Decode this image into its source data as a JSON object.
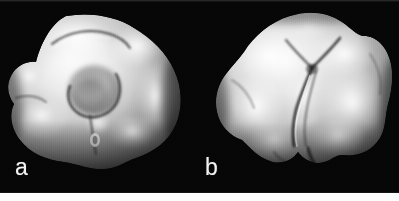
{
  "figure": {
    "kind": "scientific-figure-panel",
    "background_color": "#ffffff",
    "plate_color": "#060606",
    "label_color": "#f2f2f2",
    "surface_highlight_color": "#fdfdfd",
    "surface_midtone_color": "#b9b9b9",
    "surface_shadow_color": "#4a4a4a",
    "groove_color": "#2b2b2b",
    "panels": [
      {
        "id": "a",
        "label": "a",
        "description": "three-dimensional grayscale surface rendering of a globular particle, viewed with a large rounded central depression and a lobed left-hand protrusion"
      },
      {
        "id": "b",
        "label": "b",
        "description": "three-dimensional grayscale surface rendering of the same particle rotated, showing a branched Y-shaped cleft running down the centre and a scalloped lower edge"
      }
    ]
  }
}
